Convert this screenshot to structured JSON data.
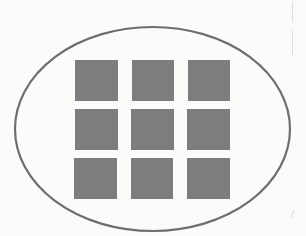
{
  "diagram": {
    "container": {
      "shape": "ellipse",
      "cx": 152.5,
      "cy": 129,
      "rx": 137.5,
      "ry": 102,
      "stroke": "#6e6e6e",
      "stroke_width": 2.2,
      "fill": "none"
    },
    "grid": {
      "rows": 3,
      "cols": 3,
      "cell_color": "#7d7d7d",
      "cells": [
        {
          "x": 75,
          "y": 60,
          "w": 43,
          "h": 41
        },
        {
          "x": 132,
          "y": 60,
          "w": 42,
          "h": 41
        },
        {
          "x": 188,
          "y": 60,
          "w": 42,
          "h": 41
        },
        {
          "x": 75,
          "y": 109,
          "w": 43,
          "h": 41
        },
        {
          "x": 131,
          "y": 109,
          "w": 43,
          "h": 41
        },
        {
          "x": 187,
          "y": 109,
          "w": 43,
          "h": 41
        },
        {
          "x": 74,
          "y": 158,
          "w": 43,
          "h": 41
        },
        {
          "x": 131,
          "y": 158,
          "w": 42,
          "h": 41
        },
        {
          "x": 187,
          "y": 158,
          "w": 43,
          "h": 41
        }
      ]
    },
    "background": "#fbfbfa"
  }
}
